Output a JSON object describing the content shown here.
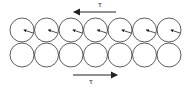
{
  "diagram": {
    "top_label": "τ",
    "bottom_label": "τ",
    "top_arrow_direction": "left",
    "bottom_arrow_direction": "right",
    "rows": 2,
    "circles_per_row": 7,
    "top_row_has_rotation_markers": true,
    "stroke_color": "#333333"
  }
}
